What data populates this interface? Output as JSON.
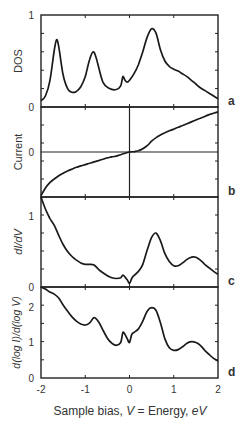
{
  "figure": {
    "xlabel_parts": [
      "Sample bias, ",
      "V",
      " = Energy, ",
      "eV"
    ],
    "x_ticks": [
      "-2",
      "-1",
      "0",
      "1",
      "2"
    ],
    "xlim": [
      -2,
      2
    ]
  },
  "panels": [
    {
      "id": "a",
      "ylabel": "DOS",
      "y_ticks": [
        "0",
        "1"
      ],
      "ylim": [
        0,
        1
      ]
    },
    {
      "id": "b",
      "ylabel": "Current",
      "y_ticks": [
        "0"
      ],
      "ylim": [
        -1,
        1
      ]
    },
    {
      "id": "c",
      "ylabel": "dI/dV",
      "y_ticks": [
        "0",
        "1"
      ],
      "ylim": [
        0,
        1.27
      ]
    },
    {
      "id": "d",
      "ylabel": "d(log I)/d(log V)",
      "y_ticks": [
        "0",
        "1",
        "2"
      ],
      "ylim": [
        0,
        2.56
      ]
    }
  ],
  "chart_data": [
    {
      "type": "line",
      "title": "a",
      "xlabel": "Sample bias, V = Energy, eV",
      "ylabel": "DOS",
      "xlim": [
        -2,
        2
      ],
      "ylim": [
        0,
        1
      ],
      "x": [
        -2.0,
        -1.9,
        -1.8,
        -1.7,
        -1.65,
        -1.6,
        -1.5,
        -1.4,
        -1.3,
        -1.2,
        -1.1,
        -1.0,
        -0.9,
        -0.82,
        -0.75,
        -0.6,
        -0.45,
        -0.3,
        -0.2,
        -0.15,
        -0.1,
        -0.05,
        0.0,
        0.1,
        0.2,
        0.3,
        0.4,
        0.5,
        0.6,
        0.7,
        0.8,
        0.9,
        1.0,
        1.1,
        1.2,
        1.3,
        1.4,
        1.5,
        1.6,
        1.7,
        1.8,
        1.9,
        2.0
      ],
      "series": [
        {
          "name": "DOS",
          "values": [
            0.07,
            0.12,
            0.28,
            0.62,
            0.73,
            0.66,
            0.35,
            0.2,
            0.16,
            0.17,
            0.22,
            0.33,
            0.52,
            0.6,
            0.53,
            0.27,
            0.2,
            0.19,
            0.23,
            0.33,
            0.29,
            0.27,
            0.29,
            0.36,
            0.46,
            0.6,
            0.76,
            0.85,
            0.8,
            0.62,
            0.5,
            0.44,
            0.41,
            0.39,
            0.36,
            0.33,
            0.29,
            0.25,
            0.21,
            0.18,
            0.15,
            0.12,
            0.09
          ]
        }
      ]
    },
    {
      "type": "line",
      "title": "b",
      "xlabel": "Sample bias, V = Energy, eV",
      "ylabel": "Current",
      "xlim": [
        -2,
        2
      ],
      "ylim": [
        -1,
        1
      ],
      "x": [
        -2.0,
        -1.9,
        -1.8,
        -1.7,
        -1.6,
        -1.5,
        -1.4,
        -1.3,
        -1.2,
        -1.1,
        -1.0,
        -0.9,
        -0.8,
        -0.7,
        -0.6,
        -0.5,
        -0.4,
        -0.3,
        -0.2,
        -0.1,
        0.0,
        0.1,
        0.2,
        0.3,
        0.4,
        0.5,
        0.6,
        0.7,
        0.8,
        0.9,
        1.0,
        1.1,
        1.2,
        1.3,
        1.4,
        1.5,
        1.6,
        1.7,
        1.8,
        1.9,
        2.0
      ],
      "series": [
        {
          "name": "Current",
          "values": [
            -0.97,
            -0.8,
            -0.68,
            -0.6,
            -0.53,
            -0.47,
            -0.42,
            -0.38,
            -0.34,
            -0.31,
            -0.28,
            -0.25,
            -0.22,
            -0.19,
            -0.16,
            -0.13,
            -0.11,
            -0.09,
            -0.06,
            -0.03,
            0.0,
            0.01,
            0.03,
            0.07,
            0.14,
            0.24,
            0.32,
            0.38,
            0.43,
            0.47,
            0.51,
            0.55,
            0.59,
            0.63,
            0.67,
            0.71,
            0.75,
            0.79,
            0.83,
            0.86,
            0.89
          ]
        }
      ]
    },
    {
      "type": "line",
      "title": "c",
      "xlabel": "Sample bias, V = Energy, eV",
      "ylabel": "dI/dV",
      "xlim": [
        -2,
        2
      ],
      "ylim": [
        0,
        1.27
      ],
      "x": [
        -2.0,
        -1.9,
        -1.8,
        -1.7,
        -1.6,
        -1.5,
        -1.4,
        -1.3,
        -1.2,
        -1.1,
        -1.0,
        -0.9,
        -0.8,
        -0.7,
        -0.6,
        -0.5,
        -0.4,
        -0.3,
        -0.2,
        -0.15,
        -0.1,
        -0.05,
        0.0,
        0.05,
        0.1,
        0.2,
        0.3,
        0.4,
        0.5,
        0.6,
        0.7,
        0.8,
        0.9,
        1.0,
        1.1,
        1.2,
        1.3,
        1.4,
        1.5,
        1.6,
        1.7,
        1.8,
        1.9,
        2.0
      ],
      "series": [
        {
          "name": "dI/dV",
          "values": [
            1.27,
            1.1,
            0.97,
            0.87,
            0.73,
            0.6,
            0.5,
            0.43,
            0.38,
            0.34,
            0.32,
            0.32,
            0.31,
            0.25,
            0.2,
            0.16,
            0.13,
            0.12,
            0.13,
            0.17,
            0.14,
            0.1,
            0.05,
            0.12,
            0.16,
            0.22,
            0.32,
            0.52,
            0.7,
            0.76,
            0.65,
            0.47,
            0.36,
            0.3,
            0.3,
            0.34,
            0.39,
            0.42,
            0.42,
            0.38,
            0.32,
            0.27,
            0.22,
            0.18
          ]
        }
      ]
    },
    {
      "type": "line",
      "title": "d",
      "xlabel": "Sample bias, V = Energy, eV",
      "ylabel": "d(log I)/d(log V)",
      "xlim": [
        -2,
        2
      ],
      "ylim": [
        0,
        2.56
      ],
      "x": [
        -2.0,
        -1.9,
        -1.8,
        -1.7,
        -1.6,
        -1.5,
        -1.4,
        -1.3,
        -1.2,
        -1.1,
        -1.0,
        -0.9,
        -0.8,
        -0.7,
        -0.6,
        -0.5,
        -0.4,
        -0.3,
        -0.2,
        -0.15,
        -0.1,
        -0.05,
        0.0,
        0.05,
        0.1,
        0.2,
        0.3,
        0.4,
        0.5,
        0.6,
        0.7,
        0.8,
        0.9,
        1.0,
        1.1,
        1.2,
        1.3,
        1.4,
        1.5,
        1.6,
        1.7,
        1.8,
        1.9,
        2.0
      ],
      "series": [
        {
          "name": "d(log I)/d(log V)",
          "values": [
            2.56,
            2.5,
            2.42,
            2.36,
            2.25,
            2.05,
            1.88,
            1.72,
            1.6,
            1.52,
            1.49,
            1.55,
            1.7,
            1.58,
            1.35,
            1.12,
            0.98,
            0.92,
            1.0,
            1.28,
            1.22,
            1.1,
            1.0,
            1.22,
            1.28,
            1.38,
            1.6,
            1.88,
            1.98,
            1.9,
            1.55,
            1.1,
            0.85,
            0.78,
            0.8,
            0.88,
            0.98,
            1.02,
            1.0,
            0.92,
            0.78,
            0.66,
            0.55,
            0.48
          ]
        }
      ]
    }
  ]
}
